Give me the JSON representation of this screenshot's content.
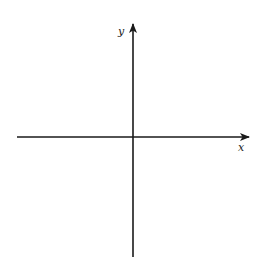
{
  "diagram": {
    "type": "cartesian-axes",
    "x_axis": {
      "label": "x",
      "direction": "right",
      "has_arrow": true
    },
    "y_axis": {
      "label": "y",
      "direction": "up",
      "has_arrow": true
    },
    "colors": {
      "axis": "#1a1a1a",
      "label": "#222222",
      "background": "#ffffff"
    }
  }
}
